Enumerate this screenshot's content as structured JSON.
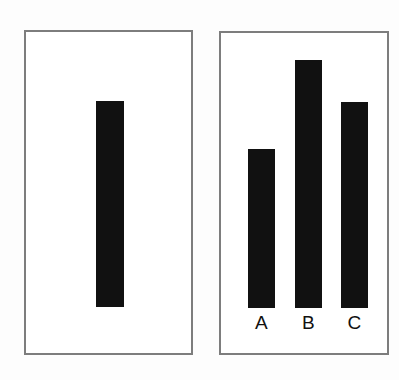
{
  "figure": {
    "background_color": "#fdfdfd",
    "panel_background": "#ffffff",
    "panel_border_color": "#7d7d7d",
    "bar_color": "#111111",
    "label_color": "#111111"
  },
  "left_panel": {
    "name": "reference-panel",
    "bar_label": ""
  },
  "right_panel": {
    "name": "comparison-panel",
    "labels": [
      "A",
      "B",
      "C"
    ]
  },
  "chart_data": [
    {
      "type": "bar",
      "title": "",
      "xlabel": "",
      "ylabel": "",
      "categories": [
        ""
      ],
      "values": [
        206
      ],
      "ylim": [
        0,
        276
      ],
      "grid": false,
      "legend": "none",
      "bar_color": "#111111",
      "notes": "Left reference panel: one unlabeled black bar, height 206 px, width 28 px, baseline at panel bottom area."
    },
    {
      "type": "bar",
      "title": "",
      "xlabel": "",
      "ylabel": "",
      "categories": [
        "A",
        "B",
        "C"
      ],
      "values": [
        159,
        248,
        206
      ],
      "ylim": [
        0,
        276
      ],
      "grid": false,
      "legend": "none",
      "bar_color": "#111111",
      "notes": "Right comparison panel: three black bars labeled A, B, C sharing a common baseline. Bar C matches the reference bar height."
    }
  ]
}
